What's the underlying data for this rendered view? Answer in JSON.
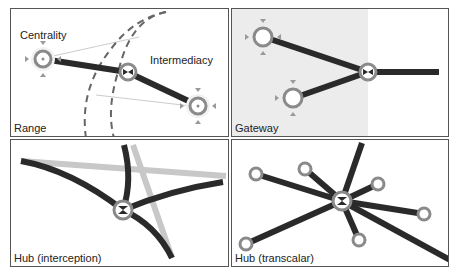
{
  "panels": [
    {
      "id": "range",
      "label": "Range",
      "annotations": {
        "centrality": "Centrality",
        "intermediacy": "Intermediacy"
      }
    },
    {
      "id": "gateway",
      "label": "Gateway"
    },
    {
      "id": "hub-interception",
      "label": "Hub (interception)"
    },
    {
      "id": "hub-transcalar",
      "label": "Hub (transcalar)"
    }
  ],
  "colors": {
    "link": "#2a2a2a",
    "node_ring": "#8a8a8a",
    "secondary_link": "#c8c8c8",
    "shade": "#ececec",
    "frame": "#555555"
  }
}
